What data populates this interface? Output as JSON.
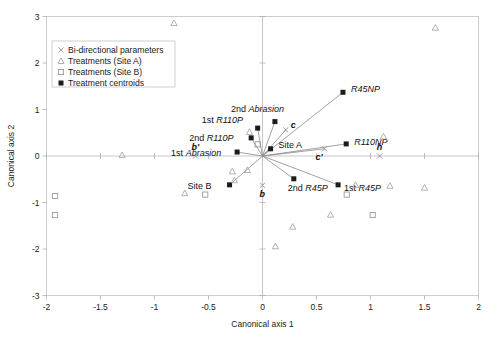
{
  "chart_data": {
    "type": "scatter",
    "title": "",
    "xlabel": "Canonical axis 1",
    "ylabel": "Canonical axis 2",
    "xlim": [
      -2,
      2
    ],
    "ylim": [
      -3,
      3
    ],
    "xticks": [
      -2,
      -1.5,
      -1,
      -0.5,
      0,
      0.5,
      1,
      1.5,
      2
    ],
    "xticklabels": [
      "-2",
      "-1.5",
      "-1",
      "-0.5",
      "0",
      "0.5",
      "1",
      "1.5",
      "2"
    ],
    "yticks": [
      -3,
      -2,
      -1,
      0,
      1,
      2,
      3
    ],
    "yticklabels": [
      "-3",
      "-2",
      "-1",
      "0",
      "1",
      "2",
      "3"
    ],
    "grid": false,
    "legend_position": "upper-left-inside",
    "legend": [
      {
        "label": "Bi-directional parameters",
        "marker": "x"
      },
      {
        "label": "Treatments (Site A)",
        "marker": "triangle-open"
      },
      {
        "label": "Treatments (Site B)",
        "marker": "square-open"
      },
      {
        "label": "Treatment centroids",
        "marker": "square-filled"
      }
    ],
    "series": [
      {
        "name": "Treatment centroids",
        "marker": "square-filled",
        "points": [
          {
            "label": "1st R110P",
            "x": -0.045,
            "y": 0.6,
            "label_dx": -56,
            "label_dy": -5
          },
          {
            "label": "2nd R110P",
            "x": -0.105,
            "y": 0.39,
            "label_dx": -62,
            "label_dy": 3
          },
          {
            "label": "1st Abrasion",
            "x": -0.235,
            "y": 0.085,
            "label_dx": -66,
            "label_dy": 4
          },
          {
            "label": "2nd Abrasion",
            "x": 0.115,
            "y": 0.74,
            "label_dx": -44,
            "label_dy": -10
          },
          {
            "label": "Site A",
            "x": 0.075,
            "y": 0.155,
            "label_dx": 8,
            "label_dy": -1
          },
          {
            "label": "Site B",
            "x": -0.305,
            "y": -0.62,
            "label_dx": -42,
            "label_dy": 4
          },
          {
            "label": "R45NP",
            "x": 0.745,
            "y": 1.37,
            "label_dx": 8,
            "label_dy": 0
          },
          {
            "label": "R110NP",
            "x": 0.775,
            "y": 0.26,
            "label_dx": 8,
            "label_dy": 1
          },
          {
            "label": "2nd R45P",
            "x": 0.29,
            "y": -0.49,
            "label_dx": -6,
            "label_dy": 12
          },
          {
            "label": "1st R45P",
            "x": 0.7,
            "y": -0.62,
            "label_dx": 6,
            "label_dy": 6
          }
        ]
      },
      {
        "name": "Bi-directional parameters",
        "marker": "x",
        "points": [
          {
            "label": "c",
            "x": 0.215,
            "y": 0.56,
            "label_dx": 5,
            "label_dy": -2,
            "italic": true
          },
          {
            "label": "c'",
            "x": 0.575,
            "y": 0.155,
            "label_dx": -9,
            "label_dy": 11,
            "italic": true
          },
          {
            "label": "h",
            "x": 1.085,
            "y": 0.0,
            "label_dx": -3,
            "label_dy": -6,
            "italic": true
          },
          {
            "label": "b'",
            "x": -0.62,
            "y": 0.0,
            "label_dx": -4,
            "label_dy": -6,
            "italic": true
          },
          {
            "label": "b",
            "x": 0.0,
            "y": -0.63,
            "label_dx": -3,
            "label_dy": 12,
            "italic": true
          }
        ]
      },
      {
        "name": "Treatments (Site A)",
        "marker": "triangle-open",
        "points": [
          {
            "x": -0.82,
            "y": 2.86
          },
          {
            "x": 1.6,
            "y": 2.76
          },
          {
            "x": -0.12,
            "y": 0.52
          },
          {
            "x": 1.12,
            "y": 0.42
          },
          {
            "x": -1.3,
            "y": 0.02
          },
          {
            "x": -0.28,
            "y": -0.33
          },
          {
            "x": -0.14,
            "y": -0.3
          },
          {
            "x": -0.26,
            "y": -0.52
          },
          {
            "x": -0.72,
            "y": -0.8
          },
          {
            "x": 0.86,
            "y": -0.62
          },
          {
            "x": 1.18,
            "y": -0.64
          },
          {
            "x": 1.5,
            "y": -0.68
          },
          {
            "x": 0.63,
            "y": -1.26
          },
          {
            "x": 0.28,
            "y": -1.52
          },
          {
            "x": 0.12,
            "y": -1.94
          }
        ]
      },
      {
        "name": "Treatments (Site B)",
        "marker": "square-open",
        "points": [
          {
            "x": -1.92,
            "y": -0.86
          },
          {
            "x": -0.53,
            "y": -0.83
          },
          {
            "x": -1.92,
            "y": -1.27
          },
          {
            "x": 1.02,
            "y": -1.27
          },
          {
            "x": 0.78,
            "y": -0.83
          },
          {
            "x": -0.045,
            "y": 0.25
          }
        ]
      }
    ],
    "vectors_from_origin": [
      {
        "to_label": "1st R110P",
        "x": -0.045,
        "y": 0.6
      },
      {
        "to_label": "2nd R110P",
        "x": -0.105,
        "y": 0.39
      },
      {
        "to_label": "1st Abrasion",
        "x": -0.235,
        "y": 0.085
      },
      {
        "to_label": "2nd Abrasion",
        "x": 0.115,
        "y": 0.74
      },
      {
        "to_label": "Site A",
        "x": 0.075,
        "y": 0.155
      },
      {
        "to_label": "Site B",
        "x": -0.305,
        "y": -0.62
      },
      {
        "to_label": "R45NP",
        "x": 0.745,
        "y": 1.37
      },
      {
        "to_label": "R110NP",
        "x": 0.775,
        "y": 0.26
      },
      {
        "to_label": "2nd R45P",
        "x": 0.29,
        "y": -0.49
      },
      {
        "to_label": "1st R45P",
        "x": 0.7,
        "y": -0.62
      },
      {
        "to_label": "c",
        "x": 0.215,
        "y": 0.56
      },
      {
        "to_label": "c'",
        "x": 0.575,
        "y": 0.155
      }
    ]
  }
}
